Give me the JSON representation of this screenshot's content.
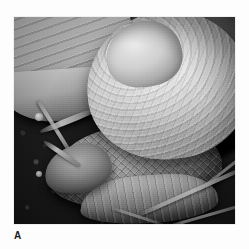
{
  "figure": {
    "panel_label": "A",
    "caption": "",
    "photo": {
      "color_mode": "grayscale",
      "alt": "Close-up grayscale photograph of a garden snail with a coiled striated shell crawling over dark soil, with a pale leaf at the upper left and thin twigs at the lower right",
      "elements": [
        {
          "name": "snail-shell",
          "description": "coiled spiral shell with concentric growth striations",
          "tone": "light"
        },
        {
          "name": "snail-body",
          "description": "textured tubercled foot and mantle",
          "tone": "mid"
        },
        {
          "name": "snail-tentacles",
          "description": "two extended eye-stalk tentacles pointing upper left",
          "tone": "light"
        },
        {
          "name": "leaf",
          "description": "pale veined leaf at upper left",
          "tone": "light"
        },
        {
          "name": "soil",
          "description": "dark gravelly earth background",
          "tone": "dark"
        },
        {
          "name": "twigs",
          "description": "thin pale stems crossing lower right",
          "tone": "light"
        }
      ]
    },
    "colors": {
      "page_background": "#fdfdfd",
      "label_text": "#1a1a1a",
      "photo_dark": "#12100e",
      "photo_light": "#eceae4"
    },
    "geometry": {
      "photo_left": 14,
      "photo_top": 17,
      "photo_width": 221,
      "photo_height": 207,
      "label_left": 14,
      "label_top": 230
    }
  }
}
